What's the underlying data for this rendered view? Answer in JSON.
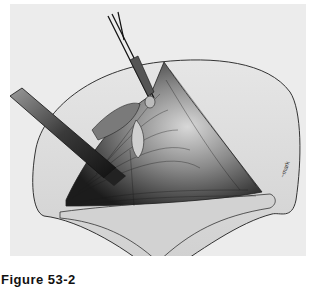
{
  "figure": {
    "caption": "Figure 53-2",
    "illustration": "surgical-illustration",
    "artist_signature": "signature-mark",
    "colors": {
      "background": "#ececec",
      "skin": "#dedede",
      "muscle_dark": "#2a2a2a",
      "muscle_light": "#bdbdbd",
      "outline": "#333333"
    }
  }
}
